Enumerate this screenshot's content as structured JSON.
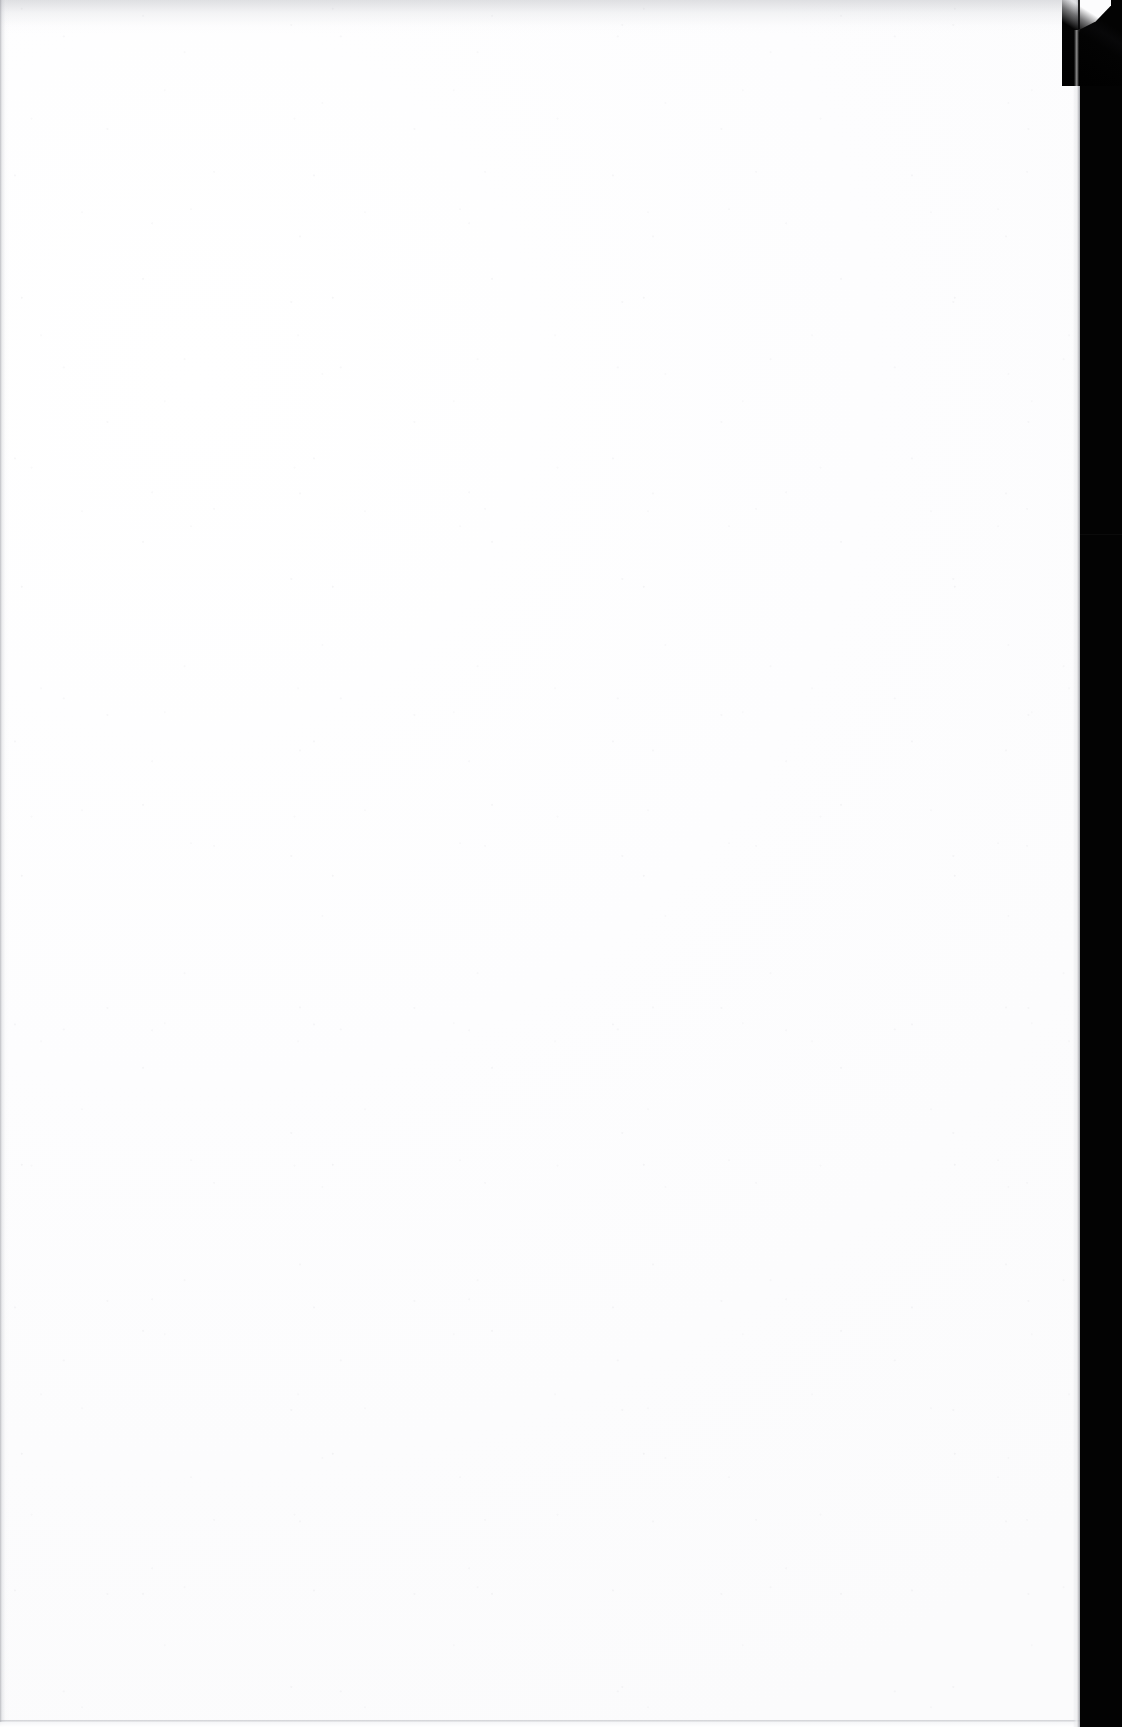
{
  "document": {
    "page_kind": "blank-scanned-page",
    "content_text": "",
    "visible_text_count": 0,
    "note": ""
  },
  "canvas": {
    "width_px": 1122,
    "height_px": 1727
  },
  "paper": {
    "left_px": 0,
    "top_px": 0,
    "width_px": 1080,
    "height_px": 1727,
    "color": "#fefefe",
    "tone_color": "#fbfbfc"
  },
  "scanner_background": {
    "color": "#030303",
    "band_left_px": 1080,
    "band_width_px": 42
  },
  "edges": {
    "top_shadow_color": "#b0b2b8",
    "left_gutter_color": "#8a8c94",
    "bottom_rule_color": "#aaacb2",
    "right_edge_color": "#96989e"
  },
  "corner": {
    "position": "top-right",
    "kind": "torn-diagonal-corner",
    "crease_color": "#121214",
    "overhang_color": "#fcfcfd",
    "overhang_left_px": 1079,
    "overhang_width_px": 32,
    "overhang_height_px": 30
  },
  "seam": {
    "top_px": 534,
    "color": "#ffffff"
  }
}
